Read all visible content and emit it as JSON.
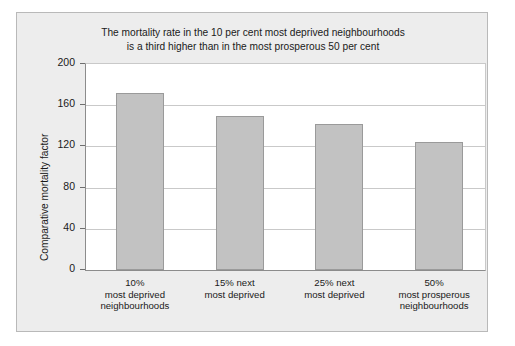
{
  "chart_data": {
    "type": "bar",
    "title": "The mortality rate in the 10 per cent most deprived neighbourhoods is a third higher than in the most prosperous 50 per cent",
    "title_lines": [
      "The mortality rate in the 10 per cent most deprived neighbourhoods",
      "is a third higher than in the most prosperous 50 per cent"
    ],
    "categories": [
      "10% most deprived neighbourhoods",
      "15% next most deprived",
      "25% next most deprived",
      "50% most prosperous neighbourhoods"
    ],
    "category_lines": [
      [
        "10%",
        "most deprived",
        "neighbourhoods"
      ],
      [
        "15% next",
        "most deprived"
      ],
      [
        "25% next",
        "most deprived"
      ],
      [
        "50%",
        "most prosperous",
        "neighbourhoods"
      ]
    ],
    "values": [
      172,
      150,
      142,
      124
    ],
    "xlabel": "",
    "ylabel": "Comparative mortality factor",
    "ylim": [
      0,
      200
    ],
    "yticks": [
      0,
      40,
      80,
      120,
      160,
      200
    ],
    "ytick_labels": [
      "0",
      "40",
      "80",
      "120",
      "160",
      "200"
    ],
    "grid": true,
    "legend": "none",
    "colors": {
      "bar_fill": "#c2c2c2",
      "bar_border": "#9a9a9a",
      "panel_background": "#ededed",
      "plot_background": "#ffffff",
      "gridline": "#c9c9c9",
      "axis": "#8c8c8c",
      "text": "#1a1a1a"
    }
  }
}
